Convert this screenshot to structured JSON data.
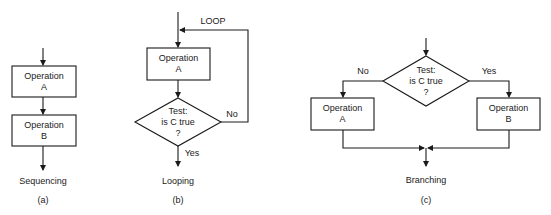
{
  "figures": {
    "a": {
      "caption": "Sequencing",
      "tag": "(a)",
      "box1": {
        "line1": "Operation",
        "line2": "A"
      },
      "box2": {
        "line1": "Operation",
        "line2": "B"
      }
    },
    "b": {
      "caption": "Looping",
      "tag": "(b)",
      "loop_label": "LOOP",
      "box1": {
        "line1": "Operation",
        "line2": "A"
      },
      "decision": {
        "line1": "Test:",
        "line2": "is C true",
        "line3": "?"
      },
      "no_label": "No",
      "yes_label": "Yes"
    },
    "c": {
      "caption": "Branching",
      "tag": "(c)",
      "decision": {
        "line1": "Test:",
        "line2": "is C true",
        "line3": "?"
      },
      "no_label": "No",
      "yes_label": "Yes",
      "boxA": {
        "line1": "Operation",
        "line2": "A"
      },
      "boxB": {
        "line1": "Operation",
        "line2": "B"
      }
    }
  },
  "colors": {
    "stroke": "#1a1a1a",
    "background": "#ffffff"
  }
}
